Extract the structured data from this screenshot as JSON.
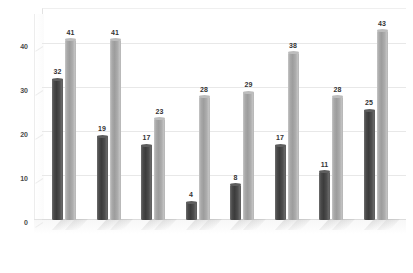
{
  "chart_data": {
    "type": "bar",
    "title": "",
    "subtitle": "",
    "xlabel": "",
    "ylabel": "",
    "ylim": [
      0,
      45
    ],
    "yticks": [
      0,
      10,
      20,
      30,
      40
    ],
    "ytick_labels": [
      "0",
      "10",
      "20",
      "30",
      "40"
    ],
    "grid": true,
    "legend_position": "top-center",
    "categories": [
      "",
      "",
      "",
      "",
      "",
      "",
      "",
      ""
    ],
    "series": [
      {
        "name": "1 or 2 doctors",
        "color": "#4a4a4a",
        "values": [
          32,
          19,
          17,
          4,
          8,
          17,
          11,
          25
        ]
      },
      {
        "name": "4 or more doctors",
        "color": "#a9a9a9",
        "values": [
          41,
          41,
          23,
          28,
          29,
          38,
          28,
          43
        ]
      }
    ],
    "data_labels": {
      "1 or 2 doctors": [
        "32",
        "19",
        "17",
        "4",
        "8",
        "17",
        "11",
        "25"
      ],
      "4 or more doctors": [
        "41",
        "41",
        "23",
        "28",
        "29",
        "38",
        "28",
        "43"
      ]
    }
  },
  "legend": {
    "entries": [
      {
        "label": "1 or 2 doctors",
        "color": "#4a4a4a"
      },
      {
        "label": "4 or more doctors",
        "color": "#a9a9a9"
      }
    ]
  },
  "axis": {
    "y_ticks": [
      {
        "label": "40",
        "value": 40
      },
      {
        "label": "30",
        "value": 30
      },
      {
        "label": "20",
        "value": 20
      },
      {
        "label": "10",
        "value": 10
      },
      {
        "label": "0",
        "value": 0
      }
    ]
  }
}
